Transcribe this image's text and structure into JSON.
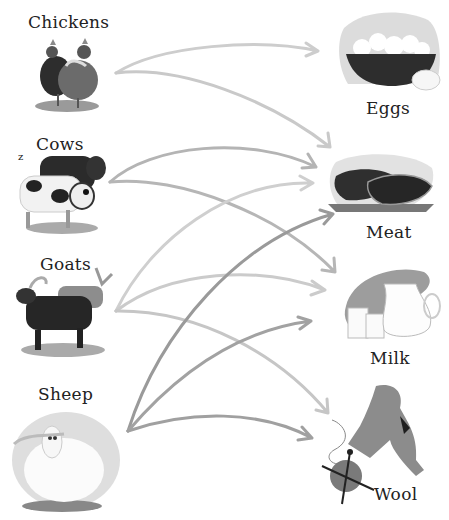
{
  "animals": [
    {
      "id": "chickens",
      "label": "Chickens"
    },
    {
      "id": "cows",
      "label": "Cows"
    },
    {
      "id": "goats",
      "label": "Goats"
    },
    {
      "id": "sheep",
      "label": "Sheep"
    }
  ],
  "products": [
    {
      "id": "eggs",
      "label": "Eggs"
    },
    {
      "id": "meat",
      "label": "Meat"
    },
    {
      "id": "milk",
      "label": "Milk"
    },
    {
      "id": "wool",
      "label": "Wool"
    }
  ],
  "connections": [
    {
      "from": "Chickens",
      "to": "Eggs"
    },
    {
      "from": "Chickens",
      "to": "Meat"
    },
    {
      "from": "Cows",
      "to": "Meat"
    },
    {
      "from": "Cows",
      "to": "Milk"
    },
    {
      "from": "Goats",
      "to": "Meat"
    },
    {
      "from": "Goats",
      "to": "Milk"
    },
    {
      "from": "Goats",
      "to": "Wool"
    },
    {
      "from": "Sheep",
      "to": "Meat"
    },
    {
      "from": "Sheep",
      "to": "Milk"
    },
    {
      "from": "Sheep",
      "to": "Wool"
    }
  ],
  "colors": {
    "arrow_light": "#c8c8c8",
    "arrow_mid": "#a8a8a8",
    "arrow_dark": "#8e8e8e",
    "text": "#222222"
  }
}
